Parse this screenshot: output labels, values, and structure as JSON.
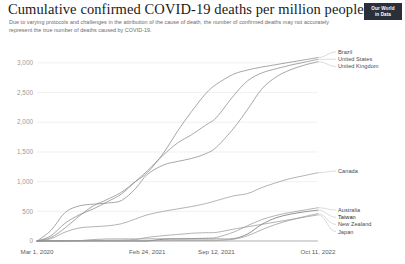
{
  "header": {
    "title": "Cumulative confirmed COVID-19 deaths per million people",
    "subtitle": "Due to varying protocols and challenges in the attribution of the cause of death, the number of confirmed deaths may not accurately represent the true number of deaths caused by COVID-19.",
    "badge_line1": "Our World",
    "badge_line2": "in Data"
  },
  "chart_data": {
    "type": "line",
    "title": "Cumulative confirmed COVID-19 deaths per million people",
    "subtitle": "Due to varying protocols and challenges in the attribution of the cause of death, the number of confirmed deaths may not accurately represent the true number of deaths caused by COVID-19.",
    "xlabel": "",
    "ylabel": "",
    "ylim": [
      0,
      3200
    ],
    "yticks": [
      0,
      500,
      1000,
      1500,
      2000,
      2500,
      3000
    ],
    "ytick_labels": [
      "0",
      "500",
      "1,000",
      "1,500",
      "2,000",
      "2,500",
      "3,000"
    ],
    "xticks": [
      0,
      0.3923,
      0.6385,
      1.0
    ],
    "xtick_labels": [
      "Mar 1, 2020",
      "Feb 24, 2021",
      "Sep 12, 2021",
      "Oct 11, 2022"
    ],
    "grid": true,
    "legend_position": "right-inline",
    "x": [
      0,
      0.05,
      0.1,
      0.15,
      0.2,
      0.25,
      0.3,
      0.35,
      0.3923,
      0.45,
      0.5,
      0.55,
      0.6,
      0.6385,
      0.7,
      0.75,
      0.8,
      0.85,
      0.9,
      0.95,
      1.0
    ],
    "series": [
      {
        "name": "Brazil",
        "color": "#8a8a8a",
        "values": [
          0,
          60,
          220,
          420,
          590,
          700,
          820,
          1000,
          1150,
          1480,
          1850,
          2180,
          2480,
          2640,
          2810,
          2880,
          2930,
          2970,
          3010,
          3050,
          3090
        ]
      },
      {
        "name": "United States",
        "color": "#8a8a8a",
        "values": [
          0,
          90,
          300,
          440,
          540,
          660,
          790,
          1000,
          1180,
          1450,
          1650,
          1790,
          1950,
          2080,
          2450,
          2700,
          2830,
          2900,
          2960,
          3010,
          3060
        ]
      },
      {
        "name": "United Kingdom",
        "color": "#8a8a8a",
        "values": [
          0,
          180,
          480,
          590,
          620,
          640,
          680,
          880,
          1120,
          1280,
          1340,
          1390,
          1470,
          1580,
          1900,
          2220,
          2560,
          2760,
          2880,
          2960,
          3020
        ]
      },
      {
        "name": "Canada",
        "color": "#9a9a9a",
        "values": [
          0,
          40,
          150,
          220,
          240,
          255,
          290,
          370,
          440,
          500,
          540,
          580,
          630,
          680,
          760,
          800,
          900,
          980,
          1050,
          1100,
          1150
        ]
      },
      {
        "name": "Australia",
        "color": "#9a9a9a",
        "values": [
          0,
          2,
          4,
          5,
          25,
          35,
          36,
          36,
          36,
          37,
          38,
          40,
          48,
          60,
          150,
          260,
          360,
          430,
          480,
          520,
          560
        ]
      },
      {
        "name": "Taiwan",
        "color": "#6d6d6d",
        "values": [
          0,
          0.2,
          0.3,
          0.3,
          0.3,
          0.3,
          0.3,
          0.3,
          0.4,
          30,
          33,
          34,
          34,
          35,
          40,
          120,
          280,
          390,
          450,
          490,
          520
        ]
      },
      {
        "name": "New Zealand",
        "color": "#9a9a9a",
        "values": [
          0,
          1,
          4,
          4,
          5,
          5,
          5,
          5,
          5,
          5,
          6,
          6,
          7,
          8,
          30,
          90,
          190,
          280,
          350,
          410,
          460
        ]
      },
      {
        "name": "Japan",
        "color": "#9a9a9a",
        "values": [
          0,
          2,
          6,
          8,
          10,
          12,
          15,
          25,
          60,
          90,
          110,
          130,
          140,
          145,
          200,
          240,
          280,
          320,
          360,
          400,
          440
        ]
      }
    ],
    "legend_groups": [
      {
        "anchor": "top",
        "entries": [
          {
            "label": "Brazil",
            "emphasis": false
          },
          {
            "label": "United States",
            "emphasis": false
          },
          {
            "label": "United Kingdom",
            "emphasis": false
          }
        ]
      },
      {
        "anchor": "middle",
        "entries": [
          {
            "label": "Canada",
            "emphasis": false
          }
        ]
      },
      {
        "anchor": "bottom",
        "entries": [
          {
            "label": "Australia",
            "emphasis": false
          },
          {
            "label": "Taiwan",
            "emphasis": true
          },
          {
            "label": "New Zealand",
            "emphasis": false
          },
          {
            "label": "Japan",
            "emphasis": false
          }
        ]
      }
    ]
  }
}
